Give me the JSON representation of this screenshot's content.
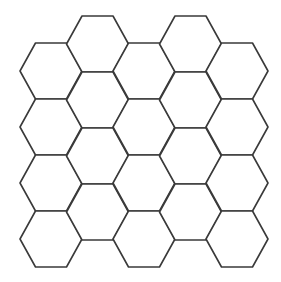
{
  "diagram": {
    "type": "hexagon-tessellation",
    "orientation": "flat-top",
    "stroke_color": "#3a3a3a",
    "fill_color": "#ffffff",
    "stroke_width": 1.6,
    "hex_width": 62,
    "hex_height": 56,
    "columns": [
      {
        "x": 20,
        "top": 43,
        "count": 4
      },
      {
        "x": 66.5,
        "top": 16,
        "count": 4
      },
      {
        "x": 113,
        "top": 43,
        "count": 4
      },
      {
        "x": 159.5,
        "top": 16,
        "count": 4
      },
      {
        "x": 206,
        "top": 43,
        "count": 4
      }
    ],
    "row_step": 56,
    "total_hexagons": 20
  }
}
